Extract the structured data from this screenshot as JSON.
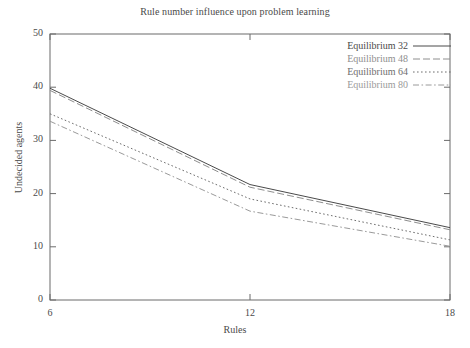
{
  "chart_data": {
    "type": "line",
    "title": "Rule number influence upon problem learning",
    "xlabel": "Rules",
    "ylabel": "Undecided agents",
    "x": [
      6,
      12,
      18
    ],
    "xlim": [
      6,
      18
    ],
    "ylim": [
      0,
      50
    ],
    "xticks": [
      "6",
      "12",
      "18"
    ],
    "yticks": [
      "0",
      "10",
      "20",
      "30",
      "40",
      "50"
    ],
    "grid": false,
    "legend_position": "top-right",
    "series": [
      {
        "name": "Equilibrium 32",
        "values": [
          39.8,
          21.7,
          13.6
        ],
        "style": "solid",
        "color": "#4a4a4a"
      },
      {
        "name": "Equilibrium 48",
        "values": [
          39.4,
          21.2,
          13.2
        ],
        "style": "dashed",
        "color": "#8e8e8e"
      },
      {
        "name": "Equilibrium 64",
        "values": [
          35.0,
          19.0,
          11.3
        ],
        "style": "dotted",
        "color": "#6e6e6e"
      },
      {
        "name": "Equilibrium 80",
        "values": [
          33.6,
          16.7,
          10.1
        ],
        "style": "dashdot",
        "color": "#9a9a9a"
      }
    ]
  }
}
